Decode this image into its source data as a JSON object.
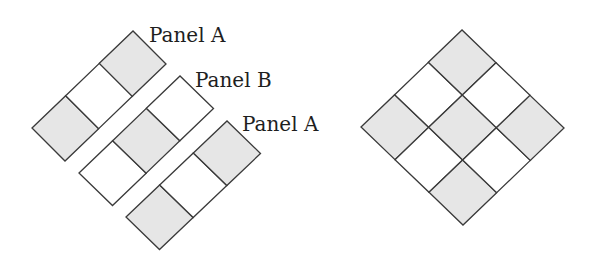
{
  "colors": {
    "gray": "#e6e6e6",
    "white": "#ffffff",
    "stroke": "#3a3a3a",
    "text": "#1e1e1e"
  },
  "strips": [
    {
      "name": "panel-a-top",
      "label": "Panel A",
      "label_pos": [
        149,
        42
      ],
      "origin": [
        32,
        128
      ],
      "u": [
        33.67,
        -32.33
      ],
      "v": [
        33,
        33
      ],
      "cells": [
        "gray",
        "white",
        "gray"
      ]
    },
    {
      "name": "panel-b",
      "label": "Panel B",
      "label_pos": [
        195,
        87
      ],
      "origin": [
        79,
        173
      ],
      "u": [
        33.67,
        -32.33
      ],
      "v": [
        33.5,
        32.5
      ],
      "cells": [
        "white",
        "gray",
        "white"
      ]
    },
    {
      "name": "panel-a-bottom",
      "label": "Panel A",
      "label_pos": [
        242,
        131
      ],
      "origin": [
        126,
        217
      ],
      "u": [
        33.67,
        -32.0
      ],
      "v": [
        33.5,
        32.5
      ],
      "cells": [
        "gray",
        "white",
        "gray"
      ]
    }
  ],
  "grid": {
    "name": "assembled-3x3-grid",
    "origin": [
      361,
      127
    ],
    "u": [
      33.67,
      -32.33
    ],
    "v": [
      34,
      32.67
    ],
    "rows": [
      [
        "gray",
        "white",
        "gray"
      ],
      [
        "white",
        "gray",
        "white"
      ],
      [
        "gray",
        "white",
        "gray"
      ]
    ]
  }
}
